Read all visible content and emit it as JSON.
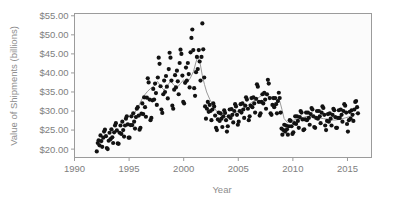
{
  "chart_data": {
    "type": "scatter",
    "title": "",
    "xlabel": "Year",
    "ylabel": "Value of Shipments (billions)",
    "xlim": [
      1990,
      2017.2
    ],
    "ylim": [
      17.8,
      55.6
    ],
    "xticks": [
      1990,
      1995,
      2000,
      2005,
      2010,
      2015
    ],
    "xtick_labels": [
      "1990",
      "1995",
      "2000",
      "2005",
      "2010",
      "2015"
    ],
    "yticks": [
      20,
      25,
      30,
      35,
      40,
      45,
      50,
      55
    ],
    "ytick_labels": [
      "$20.00",
      "$25.00",
      "$30.00",
      "$35.00",
      "$40.00",
      "$45.00",
      "$50.00",
      "$55.00"
    ],
    "grid": false,
    "legend": "none",
    "marker": "filled-circle",
    "marker_color": "#121212",
    "trend_color": "#9a9a9a",
    "series": [
      {
        "name": "Monthly value of shipments",
        "type": "scatter",
        "x": [
          1992.04,
          1992.13,
          1992.21,
          1992.29,
          1992.38,
          1992.46,
          1992.54,
          1992.63,
          1992.71,
          1992.79,
          1992.88,
          1992.96,
          1993.04,
          1993.13,
          1993.21,
          1993.29,
          1993.38,
          1993.46,
          1993.54,
          1993.63,
          1993.71,
          1993.79,
          1993.88,
          1993.96,
          1994.04,
          1994.13,
          1994.21,
          1994.29,
          1994.38,
          1994.46,
          1994.54,
          1994.63,
          1994.71,
          1994.79,
          1994.88,
          1994.96,
          1995.04,
          1995.13,
          1995.21,
          1995.29,
          1995.38,
          1995.46,
          1995.54,
          1995.63,
          1995.71,
          1995.79,
          1995.88,
          1995.96,
          1996.04,
          1996.13,
          1996.21,
          1996.29,
          1996.38,
          1996.46,
          1996.54,
          1996.63,
          1996.71,
          1996.79,
          1996.88,
          1996.96,
          1997.04,
          1997.13,
          1997.21,
          1997.29,
          1997.38,
          1997.46,
          1997.54,
          1997.63,
          1997.71,
          1997.79,
          1997.88,
          1997.96,
          1998.04,
          1998.13,
          1998.21,
          1998.29,
          1998.38,
          1998.46,
          1998.54,
          1998.63,
          1998.71,
          1998.79,
          1998.88,
          1998.96,
          1999.04,
          1999.13,
          1999.21,
          1999.29,
          1999.38,
          1999.46,
          1999.54,
          1999.63,
          1999.71,
          1999.79,
          1999.88,
          1999.96,
          2000.04,
          2000.13,
          2000.21,
          2000.29,
          2000.38,
          2000.46,
          2000.54,
          2000.63,
          2000.71,
          2000.79,
          2000.88,
          2000.96,
          2001.04,
          2001.13,
          2001.21,
          2001.29,
          2001.38,
          2001.46,
          2001.54,
          2001.63,
          2001.71,
          2001.79,
          2001.88,
          2001.96,
          2002.04,
          2002.13,
          2002.21,
          2002.29,
          2002.38,
          2002.46,
          2002.54,
          2002.63,
          2002.71,
          2002.79,
          2002.88,
          2002.96,
          2003.04,
          2003.13,
          2003.21,
          2003.29,
          2003.38,
          2003.46,
          2003.54,
          2003.63,
          2003.71,
          2003.79,
          2003.88,
          2003.96,
          2004.04,
          2004.13,
          2004.21,
          2004.29,
          2004.38,
          2004.46,
          2004.54,
          2004.63,
          2004.71,
          2004.79,
          2004.88,
          2004.96,
          2005.04,
          2005.13,
          2005.21,
          2005.29,
          2005.38,
          2005.46,
          2005.54,
          2005.63,
          2005.71,
          2005.79,
          2005.88,
          2005.96,
          2006.04,
          2006.13,
          2006.21,
          2006.29,
          2006.38,
          2006.46,
          2006.54,
          2006.63,
          2006.71,
          2006.79,
          2006.88,
          2006.96,
          2007.04,
          2007.13,
          2007.21,
          2007.29,
          2007.38,
          2007.46,
          2007.54,
          2007.63,
          2007.71,
          2007.79,
          2007.88,
          2007.96,
          2008.04,
          2008.13,
          2008.21,
          2008.29,
          2008.38,
          2008.46,
          2008.54,
          2008.63,
          2008.71,
          2008.79,
          2008.88,
          2008.96,
          2009.04,
          2009.13,
          2009.21,
          2009.29,
          2009.38,
          2009.46,
          2009.54,
          2009.63,
          2009.71,
          2009.79,
          2009.88,
          2009.96,
          2010.04,
          2010.13,
          2010.21,
          2010.29,
          2010.38,
          2010.46,
          2010.54,
          2010.63,
          2010.71,
          2010.79,
          2010.88,
          2010.96,
          2011.04,
          2011.13,
          2011.21,
          2011.29,
          2011.38,
          2011.46,
          2011.54,
          2011.63,
          2011.71,
          2011.79,
          2011.88,
          2011.96,
          2012.04,
          2012.13,
          2012.21,
          2012.29,
          2012.38,
          2012.46,
          2012.54,
          2012.63,
          2012.71,
          2012.79,
          2012.88,
          2012.96,
          2013.04,
          2013.13,
          2013.21,
          2013.29,
          2013.38,
          2013.46,
          2013.54,
          2013.63,
          2013.71,
          2013.79,
          2013.88,
          2013.96,
          2014.04,
          2014.13,
          2014.21,
          2014.29,
          2014.38,
          2014.46,
          2014.54,
          2014.63,
          2014.71,
          2014.79,
          2014.88,
          2014.96,
          2015.04,
          2015.13,
          2015.21,
          2015.29,
          2015.38,
          2015.46,
          2015.54,
          2015.63,
          2015.71,
          2015.79,
          2015.88,
          2015.96
        ],
        "y": [
          19.4,
          21.6,
          22.3,
          21.0,
          23.6,
          22.1,
          20.6,
          23.0,
          24.6,
          25.1,
          23.4,
          20.3,
          20.0,
          22.2,
          24.3,
          22.6,
          25.2,
          23.1,
          21.6,
          24.4,
          26.2,
          26.8,
          24.9,
          21.5,
          21.4,
          24.3,
          26.2,
          24.0,
          27.2,
          25.0,
          23.3,
          26.2,
          28.0,
          28.6,
          26.5,
          23.0,
          23.0,
          26.3,
          28.6,
          26.3,
          29.4,
          27.2,
          25.4,
          28.4,
          30.6,
          31.0,
          28.8,
          25.1,
          25.6,
          29.3,
          32.0,
          29.2,
          33.6,
          31.0,
          28.5,
          33.5,
          38.6,
          37.5,
          33.0,
          27.6,
          28.2,
          32.8,
          35.8,
          33.0,
          37.2,
          34.7,
          31.6,
          38.8,
          44.0,
          42.4,
          36.5,
          30.4,
          29.5,
          34.4,
          38.0,
          35.0,
          39.2,
          36.4,
          33.3,
          41.0,
          45.3,
          44.0,
          38.0,
          31.4,
          30.6,
          35.6,
          39.4,
          36.2,
          40.6,
          37.8,
          34.4,
          42.6,
          46.1,
          45.0,
          39.3,
          32.4,
          32.0,
          37.4,
          41.4,
          38.0,
          42.6,
          39.7,
          36.2,
          45.4,
          49.2,
          51.4,
          46.0,
          36.0,
          34.0,
          40.2,
          44.2,
          41.0,
          46.0,
          43.0,
          38.0,
          44.2,
          53.0,
          46.2,
          38.8,
          31.2,
          28.0,
          30.6,
          32.4,
          29.8,
          31.6,
          30.0,
          27.6,
          30.4,
          32.0,
          31.2,
          28.8,
          25.6,
          25.0,
          27.8,
          29.6,
          27.4,
          29.4,
          28.0,
          25.8,
          28.6,
          30.2,
          29.5,
          27.6,
          24.6,
          26.0,
          28.6,
          30.4,
          28.2,
          30.5,
          29.0,
          27.0,
          30.0,
          31.8,
          31.2,
          29.0,
          26.4,
          27.2,
          30.0,
          31.8,
          29.6,
          32.0,
          30.4,
          28.2,
          31.4,
          33.6,
          33.0,
          30.6,
          27.6,
          28.6,
          31.4,
          33.4,
          31.0,
          33.6,
          32.0,
          29.6,
          33.2,
          37.0,
          36.4,
          32.4,
          28.8,
          29.4,
          32.4,
          34.4,
          32.0,
          34.8,
          33.0,
          30.6,
          34.4,
          38.2,
          37.2,
          33.4,
          29.4,
          29.0,
          31.6,
          33.4,
          31.0,
          33.4,
          31.8,
          29.4,
          32.6,
          34.8,
          33.4,
          29.6,
          25.4,
          23.8,
          25.0,
          26.4,
          24.6,
          26.2,
          25.2,
          23.8,
          26.0,
          27.6,
          27.4,
          26.0,
          24.0,
          24.4,
          26.8,
          28.6,
          26.6,
          28.6,
          27.4,
          25.6,
          28.4,
          30.0,
          29.6,
          27.8,
          25.0,
          25.2,
          27.8,
          29.6,
          27.6,
          29.6,
          28.2,
          26.4,
          29.2,
          30.8,
          30.4,
          28.6,
          25.8,
          25.6,
          28.2,
          30.0,
          28.0,
          30.0,
          28.6,
          26.8,
          29.6,
          31.2,
          30.8,
          29.0,
          26.2,
          25.0,
          27.4,
          29.2,
          27.2,
          29.4,
          28.0,
          26.2,
          29.0,
          30.6,
          30.2,
          28.4,
          25.6,
          25.6,
          28.2,
          30.2,
          28.2,
          30.4,
          29.0,
          27.2,
          30.0,
          31.8,
          31.4,
          29.6,
          26.6,
          24.6,
          27.6,
          29.8,
          28.0,
          30.2,
          29.0,
          27.4,
          30.4,
          32.4,
          32.6,
          31.0,
          29.4
        ]
      },
      {
        "name": "Smoothed trend",
        "type": "line",
        "x": [
          1995.5,
          1995.9,
          1996.3,
          1996.7,
          1997.0,
          1997.3,
          1997.6,
          1997.9,
          1998.2,
          1998.5,
          1998.8,
          1999.1,
          1999.4,
          1999.7,
          2000.0,
          2000.3,
          2000.6,
          2000.9,
          2001.1,
          2001.3,
          2001.5,
          2001.7,
          2001.9,
          2002.1,
          2002.4,
          2002.7,
          2003.0,
          2003.4,
          2003.8,
          2004.2,
          2004.6,
          2005.0,
          2005.4,
          2005.8,
          2006.2,
          2006.6,
          2007.0,
          2007.3,
          2007.6,
          2007.9,
          2008.2,
          2008.5,
          2008.8,
          2009.0,
          2009.2,
          2009.5,
          2009.9,
          2010.3,
          2010.8,
          2011.3,
          2011.8,
          2012.3,
          2012.8,
          2013.3,
          2013.8,
          2014.3,
          2014.8,
          2015.3,
          2015.8
        ],
        "y": [
          29.4,
          31.5,
          33.8,
          35.2,
          36.0,
          36.6,
          37.8,
          36.4,
          35.5,
          36.6,
          37.9,
          36.8,
          36.2,
          37.2,
          38.2,
          37.4,
          38.6,
          40.4,
          42.6,
          44.4,
          42.6,
          39.4,
          37.0,
          35.0,
          33.0,
          31.4,
          30.0,
          28.8,
          28.4,
          28.8,
          29.4,
          30.0,
          30.6,
          31.4,
          32.2,
          33.0,
          33.8,
          34.2,
          34.0,
          33.6,
          33.4,
          33.2,
          32.6,
          30.4,
          28.0,
          27.0,
          27.4,
          27.8,
          28.2,
          28.6,
          28.4,
          28.2,
          28.0,
          27.8,
          27.6,
          27.8,
          28.2,
          28.6,
          29.4
        ]
      }
    ]
  },
  "axes": {
    "ylabel_text": "Value of Shipments (billions)",
    "xlabel_text": "Year"
  }
}
